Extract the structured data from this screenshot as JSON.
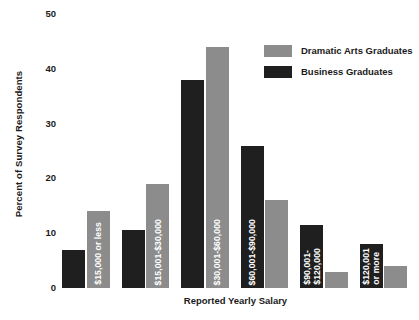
{
  "chart_data": {
    "type": "bar",
    "title": "",
    "xlabel": "Reported Yearly Salary",
    "ylabel": "Percent of Survey Respondents",
    "ylim": [
      0,
      50
    ],
    "yticks": [
      0,
      10,
      20,
      30,
      40,
      50
    ],
    "ytick_labels": [
      "0",
      "10",
      "20",
      "30",
      "40",
      "50"
    ],
    "grid": false,
    "legend_position": "upper right",
    "categories": [
      "$15,000 or less",
      "$15,001-$30,000",
      "$30,001-$60,000",
      "$60,001-$90,000",
      "$90,001-$120,000",
      "$120,001 or more"
    ],
    "category_label_lines": [
      [
        "$15,000 or less"
      ],
      [
        "$15,001-$30,000"
      ],
      [
        "$30,001-$60,000"
      ],
      [
        "$60,001-$90,000"
      ],
      [
        "$90,001-",
        "$120,000"
      ],
      [
        "$120,001",
        "or more"
      ]
    ],
    "series": [
      {
        "name": "Business Graduates",
        "color": "#1f1f1f",
        "values": [
          7,
          10.5,
          38,
          26,
          11.5,
          8
        ]
      },
      {
        "name": "Dramatic Arts Graduates",
        "color": "#8c8c8c",
        "values": [
          14,
          19,
          44,
          16,
          3,
          4
        ]
      }
    ],
    "legend_order": [
      "Dramatic Arts Graduates",
      "Business Graduates"
    ]
  },
  "legend": {
    "items": [
      {
        "label": "Dramatic Arts Graduates",
        "swatch": "gray"
      },
      {
        "label": "Business Graduates",
        "swatch": "dark"
      }
    ]
  },
  "colors": {
    "dramatic_arts": "#8c8c8c",
    "business": "#1f1f1f",
    "background": "#ffffff",
    "text": "#1a1a1a"
  }
}
